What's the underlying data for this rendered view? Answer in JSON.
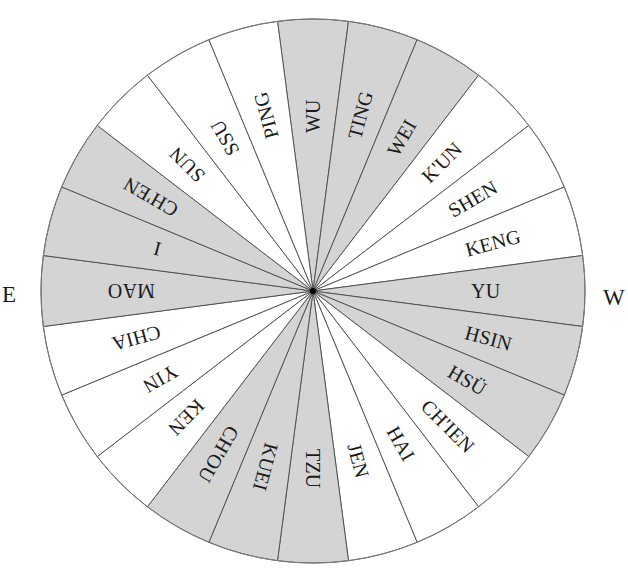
{
  "compass": {
    "center": {
      "x": 313,
      "y": 291
    },
    "radius": 272,
    "segment_span_deg": 15,
    "label_inner_radius": 158,
    "colors": {
      "shaded": "#d4d4d4",
      "plain": "#ffffff",
      "divider": "#4a4a4a",
      "outline": "#7a7a7a",
      "text": "#1a1a1a",
      "hub": "#000000"
    },
    "segments": [
      {
        "label": "WU",
        "angle": 0,
        "shaded": true
      },
      {
        "label": "TING",
        "angle": 15,
        "shaded": true
      },
      {
        "label": "WEI",
        "angle": 30,
        "shaded": true
      },
      {
        "label": "K'UN",
        "angle": 45,
        "shaded": false
      },
      {
        "label": "SHEN",
        "angle": 60,
        "shaded": false
      },
      {
        "label": "KENG",
        "angle": 75,
        "shaded": false
      },
      {
        "label": "YU",
        "angle": 90,
        "shaded": true
      },
      {
        "label": "HSIN",
        "angle": 105,
        "shaded": true
      },
      {
        "label": "HSÜ",
        "angle": 120,
        "shaded": true
      },
      {
        "label": "CH'IEN",
        "angle": 135,
        "shaded": false
      },
      {
        "label": "HAI",
        "angle": 150,
        "shaded": false
      },
      {
        "label": "JEN",
        "angle": 165,
        "shaded": false
      },
      {
        "label": "TZU",
        "angle": 180,
        "shaded": true
      },
      {
        "label": "KUEI",
        "angle": 195,
        "shaded": true
      },
      {
        "label": "CH'OU",
        "angle": 210,
        "shaded": true
      },
      {
        "label": "KEN",
        "angle": 225,
        "shaded": false
      },
      {
        "label": "YIN",
        "angle": 240,
        "shaded": false
      },
      {
        "label": "CHIA",
        "angle": 255,
        "shaded": false
      },
      {
        "label": "MAO",
        "angle": 270,
        "shaded": true
      },
      {
        "label": "I",
        "angle": 285,
        "shaded": true
      },
      {
        "label": "CH'EN",
        "angle": 300,
        "shaded": true
      },
      {
        "label": "SUN",
        "angle": 315,
        "shaded": false
      },
      {
        "label": "SSU",
        "angle": 330,
        "shaded": false
      },
      {
        "label": "PING",
        "angle": 345,
        "shaded": false
      }
    ]
  },
  "cardinals": {
    "east": "E",
    "west": "W"
  }
}
